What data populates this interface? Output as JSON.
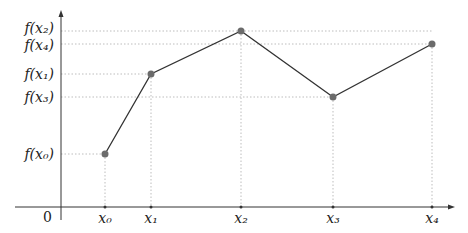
{
  "chart_data": {
    "type": "line",
    "title": "",
    "xlabel": "",
    "ylabel": "",
    "origin_label": "0",
    "grid": "dotted guide lines from each point to both axes",
    "legend": null,
    "x_tick_labels": [
      "x₀",
      "x₁",
      "x₂",
      "x₃",
      "x₄"
    ],
    "y_tick_labels": [
      "f(x₀)",
      "f(x₁)",
      "f(x₂)",
      "f(x₃)",
      "f(x₄)"
    ],
    "points": [
      {
        "x_label": "x₀",
        "y_label": "f(x₀)",
        "px": 105,
        "py": 154
      },
      {
        "x_label": "x₁",
        "y_label": "f(x₁)",
        "px": 151,
        "py": 74
      },
      {
        "x_label": "x₂",
        "y_label": "f(x₂)",
        "px": 241,
        "py": 31
      },
      {
        "x_label": "x₃",
        "y_label": "f(x₃)",
        "px": 333,
        "py": 97
      },
      {
        "x_label": "x₄",
        "y_label": "f(x₄)",
        "px": 432,
        "py": 44
      }
    ],
    "y_order_top_to_bottom": [
      "f(x₂)",
      "f(x₄)",
      "f(x₁)",
      "f(x₃)",
      "f(x₀)"
    ],
    "axes": {
      "origin_px": [
        61,
        207
      ],
      "x_end_px": 455,
      "x_start_px": 15,
      "y_top_px": 10,
      "y_bottom_px": 220
    },
    "colors": {
      "line": "#333333",
      "marker": "#6b6b6b",
      "axis": "#333333",
      "guide": "#bdbdbd"
    }
  }
}
